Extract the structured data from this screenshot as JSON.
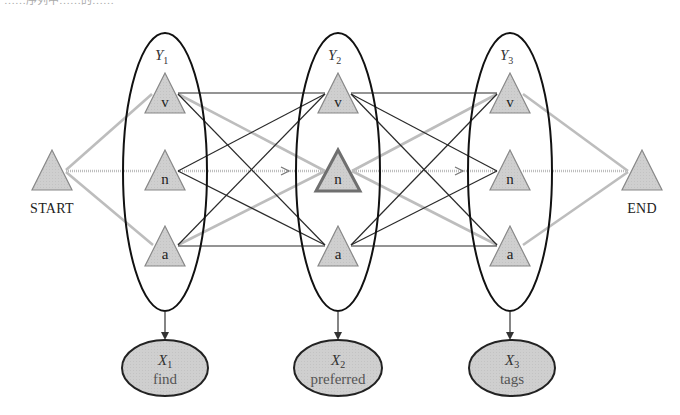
{
  "header_fragment": "……序列中……的……",
  "diagram": {
    "colors": {
      "node_fill": "#cfcfcf",
      "node_stroke": "#888888",
      "highlight_node_stroke": "#6f6f6f",
      "black_edge": "#2a2a2a",
      "gray_edge": "#bdbdbd",
      "ellipse_stroke": "#111111",
      "observation_fill": "#c8c8c8"
    },
    "start": {
      "label": "START"
    },
    "end": {
      "label": "END"
    },
    "hidden_variables": [
      {
        "name": "Y",
        "sub": "1",
        "states": [
          "v",
          "n",
          "a"
        ]
      },
      {
        "name": "Y",
        "sub": "2",
        "states": [
          "v",
          "n",
          "a"
        ],
        "highlighted_state": "n"
      },
      {
        "name": "Y",
        "sub": "3",
        "states": [
          "v",
          "n",
          "a"
        ]
      }
    ],
    "observations": [
      {
        "name": "X",
        "sub": "1",
        "word": "find"
      },
      {
        "name": "X",
        "sub": "2",
        "word": "preferred"
      },
      {
        "name": "X",
        "sub": "3",
        "word": "tags"
      }
    ],
    "gray_edges": [
      [
        "START",
        "Y1.v"
      ],
      [
        "START",
        "Y1.n"
      ],
      [
        "START",
        "Y1.a"
      ],
      [
        "Y1.v",
        "Y2.n"
      ],
      [
        "Y1.n",
        "Y2.n"
      ],
      [
        "Y1.a",
        "Y2.n"
      ],
      [
        "Y2.n",
        "Y3.v"
      ],
      [
        "Y2.n",
        "Y3.n"
      ],
      [
        "Y2.n",
        "Y3.a"
      ],
      [
        "Y3.v",
        "END"
      ],
      [
        "Y3.n",
        "END"
      ],
      [
        "Y3.a",
        "END"
      ]
    ],
    "black_edges": [
      [
        "Y1.v",
        "Y2.v"
      ],
      [
        "Y1.v",
        "Y2.a"
      ],
      [
        "Y1.n",
        "Y2.v"
      ],
      [
        "Y1.n",
        "Y2.a"
      ],
      [
        "Y1.a",
        "Y2.v"
      ],
      [
        "Y1.a",
        "Y2.a"
      ],
      [
        "Y2.v",
        "Y3.v"
      ],
      [
        "Y2.v",
        "Y3.n"
      ],
      [
        "Y2.v",
        "Y3.a"
      ],
      [
        "Y2.a",
        "Y3.v"
      ],
      [
        "Y2.a",
        "Y3.n"
      ],
      [
        "Y2.a",
        "Y3.a"
      ]
    ]
  }
}
